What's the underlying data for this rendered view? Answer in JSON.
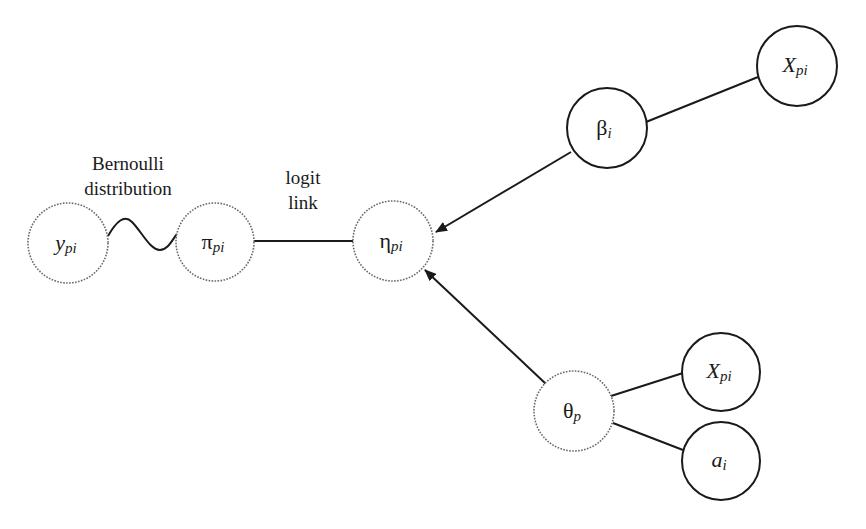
{
  "diagram": {
    "type": "graphical-model",
    "labels": {
      "bernoulli_line1": "Bernoulli",
      "bernoulli_line2": "distribution",
      "logit_line1": "logit",
      "logit_line2": "link"
    },
    "nodes": [
      {
        "id": "y",
        "main": "y",
        "sub": "pi",
        "main_italic": true,
        "style": "latent",
        "cx": 68,
        "cy": 243,
        "r": 40
      },
      {
        "id": "pi",
        "main": "π",
        "sub": "pi",
        "main_italic": false,
        "style": "latent",
        "cx": 215,
        "cy": 242,
        "r": 39
      },
      {
        "id": "eta",
        "main": "η",
        "sub": "pi",
        "main_italic": false,
        "style": "latent",
        "cx": 393,
        "cy": 241,
        "r": 40
      },
      {
        "id": "beta",
        "main": "β",
        "sub": "i",
        "main_italic": false,
        "style": "observed",
        "cx": 607,
        "cy": 128,
        "r": 40
      },
      {
        "id": "x_top",
        "main": "X",
        "sub": "pi",
        "main_italic": true,
        "style": "observed",
        "cx": 797,
        "cy": 66,
        "r": 40
      },
      {
        "id": "theta",
        "main": "θ",
        "sub": "p",
        "main_italic": false,
        "style": "latent",
        "cx": 574,
        "cy": 411,
        "r": 40
      },
      {
        "id": "x_bottom",
        "main": "X",
        "sub": "pi",
        "main_italic": true,
        "style": "observed",
        "cx": 721,
        "cy": 372,
        "r": 39
      },
      {
        "id": "a",
        "main": "a",
        "sub": "i",
        "main_italic": true,
        "style": "observed",
        "cx": 721,
        "cy": 461,
        "r": 39
      }
    ],
    "edges": [
      {
        "from": "y",
        "to": "pi",
        "kind": "wave",
        "label": "Bernoulli distribution"
      },
      {
        "from": "pi",
        "to": "eta",
        "kind": "line",
        "label": "logit link"
      },
      {
        "from": "beta",
        "to": "eta",
        "kind": "arrow"
      },
      {
        "from": "theta",
        "to": "eta",
        "kind": "arrow"
      },
      {
        "from": "x_top",
        "to": "beta",
        "kind": "line"
      },
      {
        "from": "x_bottom",
        "to": "theta",
        "kind": "line"
      },
      {
        "from": "a",
        "to": "theta",
        "kind": "line"
      }
    ],
    "colors": {
      "ink": "#1a1a1a",
      "latent_stroke": "#6a6a6a",
      "background": "#ffffff"
    }
  }
}
